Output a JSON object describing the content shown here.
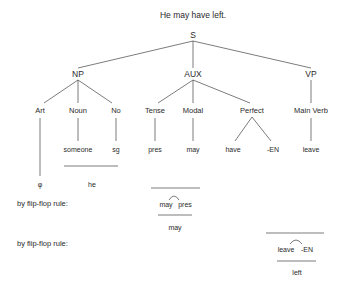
{
  "title": "He may have left.",
  "tree": {
    "root": "S",
    "level1": {
      "np": "NP",
      "aux": "AUX",
      "vp": "VP"
    },
    "level2": {
      "art": "Art",
      "noun": "Noun",
      "no": "No",
      "tense": "Tense",
      "modal": "Modal",
      "perfect": "Perfect",
      "main_verb": "Main Verb"
    },
    "leaves": {
      "someone": "someone",
      "sg": "sg",
      "pres": "pres",
      "may": "may",
      "have": "have",
      "en": "-EN",
      "leave": "leave"
    }
  },
  "derivations": {
    "art_result": "φ",
    "np_result": "he",
    "rule_label_1": "by flip-flop rule:",
    "rule1_input_a": "may",
    "rule1_input_b": "pres",
    "rule1_output": "may",
    "rule_label_2": "by flip-flop rule:",
    "rule2_input_a": "leave",
    "rule2_input_b": "-EN",
    "rule2_output": "left"
  },
  "colors": {
    "ink": "#2a2a2a",
    "line": "#444444",
    "background": "#ffffff"
  }
}
